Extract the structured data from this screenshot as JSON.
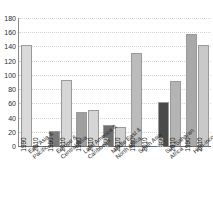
{
  "chart_data": {
    "type": "bar",
    "title": "",
    "subtitle": "",
    "xlabel": "",
    "ylabel": "",
    "ylim": [
      0,
      180
    ],
    "ytick_step": 20,
    "yticks": [
      0,
      20,
      40,
      60,
      80,
      100,
      120,
      140,
      160,
      180
    ],
    "grid": true,
    "legend": "none",
    "series_labels_inside_bars": true,
    "categories": [
      "East Asia &\nPacific",
      "Europe &\nCentral Asia",
      "Latin America &\nCaribbean",
      "Middle East &\nNorth Africa",
      "South Asia",
      "Sub-Saharan\nAfrica",
      "High-income"
    ],
    "series": [
      {
        "name": "1990",
        "values": [
          142,
          21,
          48,
          30,
          131,
          62,
          157
        ]
      },
      {
        "name": "2010",
        "values": [
          1,
          93,
          50,
          27,
          1,
          91,
          142
        ]
      }
    ],
    "bar_colors": {
      "east-asia-pacific": {
        "1990": "#d9d9d9",
        "2010": "#fbfbfb"
      },
      "europe-central-asia": {
        "1990": "#7a7a7a",
        "2010": "#d6d6d6"
      },
      "latin-america-caribbean": {
        "1990": "#9f9f9f",
        "2010": "#d5d5d5"
      },
      "middle-east-north-africa": {
        "1990": "#6f6f6f",
        "2010": "#cfcfcf"
      },
      "south-asia": {
        "1990": "#bcbcbc",
        "2010": "#fbfbfb"
      },
      "sub-saharan-africa": {
        "1990": "#4a4a4a",
        "2010": "#b4b4b4"
      },
      "high-income": {
        "1990": "#a8a8a8",
        "2010": "#c9c9c9"
      }
    },
    "axis_color": "#6f6f6f",
    "gridline_color": "#d2d2d2",
    "background_color": "#ffffff"
  },
  "y_ticks": [
    {
      "label": "180"
    },
    {
      "label": "160"
    },
    {
      "label": "140"
    },
    {
      "label": "120"
    },
    {
      "label": "100"
    },
    {
      "label": "80"
    },
    {
      "label": "60"
    },
    {
      "label": "40"
    },
    {
      "label": "20"
    },
    {
      "label": "0"
    }
  ],
  "groups": [
    {
      "key": "east-asia-pacific",
      "label": "East Asia &\nPacific",
      "bars": [
        {
          "series": "1990",
          "value": 142,
          "color": "#d9d9d9",
          "label": "1990",
          "dark": false
        },
        {
          "series": "2010",
          "value": 1,
          "color": "#fbfbfb",
          "label": "2010",
          "dark": false
        }
      ]
    },
    {
      "key": "europe-central-asia",
      "label": "Europe &\nCentral Asia",
      "bars": [
        {
          "series": "1990",
          "value": 21,
          "color": "#7a7a7a",
          "label": "1990",
          "dark": false
        },
        {
          "series": "2010",
          "value": 93,
          "color": "#d6d6d6",
          "label": "2010",
          "dark": false
        }
      ]
    },
    {
      "key": "latin-america-caribbean",
      "label": "Latin America &\nCaribbean",
      "bars": [
        {
          "series": "1990",
          "value": 48,
          "color": "#9f9f9f",
          "label": "1990",
          "dark": false
        },
        {
          "series": "2010",
          "value": 50,
          "color": "#d5d5d5",
          "label": "2010",
          "dark": false
        }
      ]
    },
    {
      "key": "middle-east-north-africa",
      "label": "Middle East &\nNorth Africa",
      "bars": [
        {
          "series": "1990",
          "value": 30,
          "color": "#6f6f6f",
          "label": "1990",
          "dark": true
        },
        {
          "series": "2010",
          "value": 27,
          "color": "#cfcfcf",
          "label": "2010",
          "dark": false
        }
      ]
    },
    {
      "key": "south-asia",
      "label": "South Asia",
      "bars": [
        {
          "series": "1990",
          "value": 131,
          "color": "#bcbcbc",
          "label": "1990",
          "dark": false
        },
        {
          "series": "2010",
          "value": 1,
          "color": "#fbfbfb",
          "label": "2010",
          "dark": false
        }
      ]
    },
    {
      "key": "sub-saharan-africa",
      "label": "Sub-Saharan\nAfrica",
      "bars": [
        {
          "series": "1990",
          "value": 62,
          "color": "#4a4a4a",
          "label": "1990",
          "dark": true
        },
        {
          "series": "2010",
          "value": 91,
          "color": "#b4b4b4",
          "label": "2010",
          "dark": false
        }
      ]
    },
    {
      "key": "high-income",
      "label": "High-income",
      "bars": [
        {
          "series": "1990",
          "value": 157,
          "color": "#a8a8a8",
          "label": "1990",
          "dark": false
        },
        {
          "series": "2010",
          "value": 142,
          "color": "#c9c9c9",
          "label": "2010",
          "dark": false
        }
      ]
    }
  ]
}
